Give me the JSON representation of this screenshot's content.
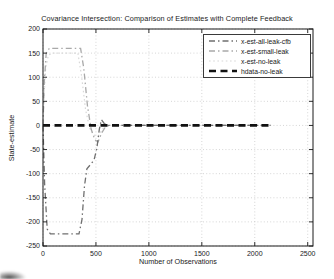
{
  "chart_data": {
    "type": "line",
    "title": "Covariance Intersection: Comparison of Estimates with Complete Feedback",
    "xlabel": "Number of Observations",
    "ylabel": "State-estimate",
    "xlim": [
      0,
      2550
    ],
    "ylim": [
      -250,
      200
    ],
    "x_ticks": [
      0,
      500,
      1000,
      1500,
      2000,
      2500
    ],
    "y_ticks": [
      -250,
      -200,
      -150,
      -100,
      -50,
      0,
      50,
      100,
      150,
      200
    ],
    "grid": true,
    "legend_position": "top-right",
    "axis_color": "#1a1a1a",
    "grid_color": "#c4c4c4",
    "text_color": "#1a1a1a",
    "series": [
      {
        "name": "x-est-all-leak-cfb",
        "color": "#6f6f6f",
        "style": "dash-dot",
        "width": 1.3,
        "points": [
          [
            0,
            0
          ],
          [
            15,
            -120
          ],
          [
            40,
            -215
          ],
          [
            70,
            -225
          ],
          [
            340,
            -225
          ],
          [
            368,
            -195
          ],
          [
            392,
            -125
          ],
          [
            415,
            -90
          ],
          [
            445,
            -82
          ],
          [
            482,
            -72
          ],
          [
            508,
            -48
          ],
          [
            532,
            -8
          ],
          [
            552,
            12
          ],
          [
            578,
            4
          ],
          [
            605,
            0
          ],
          [
            2150,
            0
          ]
        ]
      },
      {
        "name": "x-est-small-leak",
        "color": "#a9a9a9",
        "style": "dash-dot",
        "width": 1.3,
        "points": [
          [
            0,
            0
          ],
          [
            12,
            90
          ],
          [
            30,
            150
          ],
          [
            60,
            160
          ],
          [
            355,
            160
          ],
          [
            385,
            118
          ],
          [
            420,
            40
          ],
          [
            455,
            -8
          ],
          [
            490,
            -30
          ],
          [
            520,
            -34
          ],
          [
            555,
            -15
          ],
          [
            590,
            -3
          ],
          [
            625,
            0
          ],
          [
            2150,
            0
          ]
        ]
      },
      {
        "name": "x-est-no-leak",
        "color": "#d8d8d8",
        "style": "dotted",
        "width": 1.2,
        "points": [
          [
            0,
            0
          ],
          [
            10,
            60
          ],
          [
            25,
            118
          ],
          [
            50,
            145
          ],
          [
            85,
            150
          ],
          [
            330,
            150
          ],
          [
            365,
            102
          ],
          [
            402,
            32
          ],
          [
            442,
            -6
          ],
          [
            482,
            -20
          ],
          [
            522,
            -22
          ],
          [
            560,
            -8
          ],
          [
            600,
            0
          ],
          [
            2150,
            0
          ]
        ]
      },
      {
        "name": "hdata-no-leak",
        "color": "#111111",
        "style": "dashed",
        "width": 2.6,
        "points": [
          [
            0,
            0
          ],
          [
            2150,
            0
          ]
        ]
      }
    ]
  }
}
